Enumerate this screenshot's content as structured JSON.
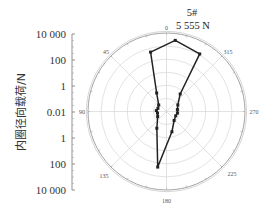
{
  "chart_data": {
    "type": "polar-line",
    "title": "5#",
    "subtitle": "5 555 N",
    "ylabel": "内圈径向载荷/N",
    "radial_scale": "log (mirrored axis)",
    "radial_range": [
      0.01,
      10000
    ],
    "left_axis_ticks": [
      "10 000",
      "100",
      "1",
      "0.01",
      "1",
      "100",
      "10 000"
    ],
    "angle_ticks": [
      "0",
      "45",
      "90",
      "135",
      "180",
      "225",
      "270",
      "315"
    ],
    "angle_direction": "counter-clockwise, 0 at top",
    "grid": true,
    "rings": 6,
    "points": [
      {
        "angle": 353,
        "value": 3000
      },
      {
        "angle": 15,
        "value": 500
      },
      {
        "angle": 28,
        "value": 0.4
      },
      {
        "angle": 50,
        "value": 0.06
      },
      {
        "angle": 70,
        "value": 0.05
      },
      {
        "angle": 85,
        "value": 0.06
      },
      {
        "angle": 100,
        "value": 0.05
      },
      {
        "angle": 120,
        "value": 0.06
      },
      {
        "angle": 150,
        "value": 0.3
      },
      {
        "angle": 171,
        "value": 200
      },
      {
        "angle": 195,
        "value": 0.4
      },
      {
        "angle": 220,
        "value": 0.08
      },
      {
        "angle": 245,
        "value": 0.06
      },
      {
        "angle": 262,
        "value": 0.07
      },
      {
        "angle": 280,
        "value": 0.07
      },
      {
        "angle": 300,
        "value": 0.1
      },
      {
        "angle": 322,
        "value": 0.5
      },
      {
        "angle": 330,
        "value": 1200
      }
    ]
  },
  "labels": {
    "title": "5#",
    "subtitle": "5 555 N",
    "ylabel": "内圈径向载荷/N",
    "angle_0": "0",
    "angle_45": "45",
    "angle_90": "90",
    "angle_135": "135",
    "angle_180": "180",
    "angle_225": "225",
    "angle_270": "270",
    "angle_315": "315",
    "tick_0": "10 000",
    "tick_1": "100",
    "tick_2": "1",
    "tick_3": "0.01",
    "tick_4": "1",
    "tick_5": "100",
    "tick_6": "10 000"
  },
  "colors": {
    "line": "#222222",
    "grid": "#cfcfcf",
    "axis": "#777777"
  }
}
